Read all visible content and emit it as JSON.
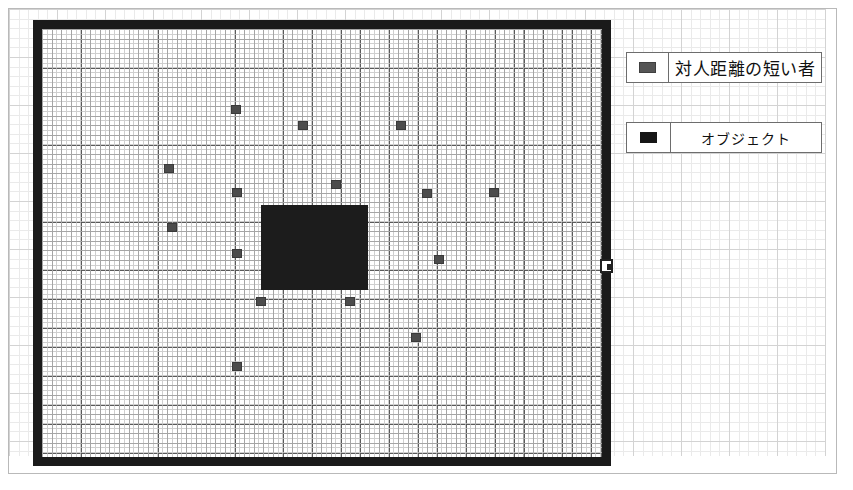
{
  "figure": {
    "type": "scatter-grid-map",
    "background": "#ffffff",
    "frame_color": "#1a1a1a"
  },
  "legend": {
    "position": "right",
    "items": [
      {
        "swatch_name": "person-swatch",
        "swatch_color": "#555555",
        "label": "対人距離の短い者"
      },
      {
        "swatch_name": "object-swatch",
        "swatch_color": "#161616",
        "label": "オブジェクト"
      }
    ]
  },
  "chart_data": {
    "type": "scatter",
    "title": "",
    "xlabel": "",
    "ylabel": "",
    "grid": true,
    "legend_position": "right",
    "xlim": [
      0,
      560
    ],
    "ylim": [
      0,
      428
    ],
    "series": [
      {
        "name": "対人距離の短い者",
        "color": "#4c4c4c",
        "marker": "square",
        "points": [
          {
            "x": 194,
            "y": 80
          },
          {
            "x": 261,
            "y": 96
          },
          {
            "x": 359,
            "y": 96
          },
          {
            "x": 127,
            "y": 139
          },
          {
            "x": 294,
            "y": 155
          },
          {
            "x": 195,
            "y": 163
          },
          {
            "x": 385,
            "y": 164
          },
          {
            "x": 452,
            "y": 163
          },
          {
            "x": 130,
            "y": 198
          },
          {
            "x": 195,
            "y": 224
          },
          {
            "x": 397,
            "y": 230
          },
          {
            "x": 219,
            "y": 272
          },
          {
            "x": 308,
            "y": 272
          },
          {
            "x": 374,
            "y": 308
          },
          {
            "x": 195,
            "y": 337
          }
        ]
      },
      {
        "name": "オブジェクト",
        "color": "#1c1c1c",
        "marker": "rectangle",
        "rectangles": [
          {
            "x": 219,
            "y": 176,
            "width": 107,
            "height": 85
          }
        ]
      }
    ]
  },
  "controls": {
    "resize_handle_name": "resize-handle"
  }
}
